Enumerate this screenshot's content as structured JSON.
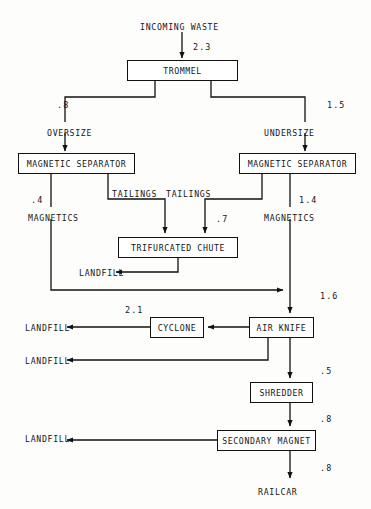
{
  "diagram": {
    "units_note": "",
    "line_color": "#111111",
    "text_color": "#151515",
    "background": "#fdfdfc"
  },
  "nodes": [
    {
      "id": "trommel",
      "label": "TROMMEL",
      "x": 127,
      "y": 60,
      "w": 111,
      "h": 21
    },
    {
      "id": "mag-sep-left",
      "label": "MAGNETIC SEPARATOR",
      "x": 18,
      "y": 153,
      "w": 117,
      "h": 21
    },
    {
      "id": "mag-sep-right",
      "label": "MAGNETIC SEPARATOR",
      "x": 239,
      "y": 153,
      "w": 117,
      "h": 21
    },
    {
      "id": "trifurcated-chute",
      "label": "TRIFURCATED CHUTE",
      "x": 118,
      "y": 237,
      "w": 120,
      "h": 21
    },
    {
      "id": "cyclone",
      "label": "CYCLONE",
      "x": 150,
      "y": 317,
      "w": 54,
      "h": 21
    },
    {
      "id": "air-knife",
      "label": "AIR KNIFE",
      "x": 249,
      "y": 317,
      "w": 65,
      "h": 21
    },
    {
      "id": "shredder",
      "label": "SHREDDER",
      "x": 250,
      "y": 382,
      "w": 63,
      "h": 21
    },
    {
      "id": "secondary-magnet",
      "label": "SECONDARY MAGNET",
      "x": 217,
      "y": 430,
      "w": 99,
      "h": 21
    }
  ],
  "terminals": [
    {
      "id": "incoming-waste",
      "label": "INCOMING WASTE",
      "x": 140,
      "y": 22
    },
    {
      "id": "oversize",
      "label": "OVERSIZE",
      "x": 47,
      "y": 128
    },
    {
      "id": "undersize",
      "label": "UNDERSIZE",
      "x": 264,
      "y": 128
    },
    {
      "id": "magnetics-left",
      "label": "MAGNETICS",
      "x": 28,
      "y": 213
    },
    {
      "id": "magnetics-right",
      "label": "MAGNETICS",
      "x": 264,
      "y": 213
    },
    {
      "id": "tailings-left",
      "label": "TAILINGS",
      "x": 112,
      "y": 189
    },
    {
      "id": "tailings-right",
      "label": "TAILINGS",
      "x": 166,
      "y": 189
    },
    {
      "id": "landfill-chute",
      "label": "LANDFILL",
      "x": 79,
      "y": 268
    },
    {
      "id": "landfill-cyclone",
      "label": "LANDFILL",
      "x": 25,
      "y": 323
    },
    {
      "id": "landfill-airknife",
      "label": "LANDFILL",
      "x": 25,
      "y": 356
    },
    {
      "id": "landfill-magnet",
      "label": "LANDFILL",
      "x": 25,
      "y": 434
    },
    {
      "id": "railcar",
      "label": "RAILCAR",
      "x": 258,
      "y": 487
    }
  ],
  "flow_values": [
    {
      "id": "val-incoming",
      "value": "2.3",
      "x": 193,
      "y": 42
    },
    {
      "id": "val-oversize",
      "value": ".8",
      "x": 57,
      "y": 100
    },
    {
      "id": "val-undersize",
      "value": "1.5",
      "x": 327,
      "y": 100
    },
    {
      "id": "val-magnetics-left",
      "value": ".4",
      "x": 31,
      "y": 195
    },
    {
      "id": "val-magnetics-right",
      "value": "1.4",
      "x": 299,
      "y": 195
    },
    {
      "id": "val-chute-feed",
      "value": ".7",
      "x": 216,
      "y": 214
    },
    {
      "id": "val-airknife-feed",
      "value": "1.6",
      "x": 320,
      "y": 291
    },
    {
      "id": "val-cyclone-out",
      "value": "2.1",
      "x": 125,
      "y": 305
    },
    {
      "id": "val-shredder-feed",
      "value": ".5",
      "x": 320,
      "y": 366
    },
    {
      "id": "val-magnet-feed",
      "value": ".8",
      "x": 320,
      "y": 414
    },
    {
      "id": "val-railcar",
      "value": ".8",
      "x": 320,
      "y": 463
    }
  ]
}
